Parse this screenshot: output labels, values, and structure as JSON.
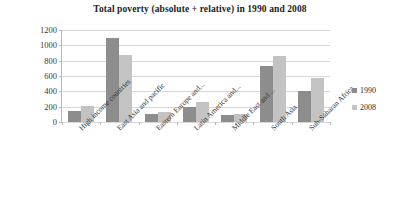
{
  "chart_data": {
    "type": "bar",
    "title": "Total poverty (absolute + relative) in 1990 and 2008",
    "xlabel": "",
    "ylabel": "",
    "ylim": [
      0,
      1200
    ],
    "yticks": [
      0,
      200,
      400,
      600,
      800,
      1000,
      1200
    ],
    "grid": true,
    "legend_position": "right",
    "categories": [
      "High income countries",
      "East Asia and pacific",
      "Eastern Europe and...",
      "Latin America and...",
      "Middle East and ...",
      "South Asia",
      "Sub-Saharan Africa"
    ],
    "series": [
      {
        "name": "1990",
        "color": "#8d8d8d",
        "values": [
          150,
          1100,
          110,
          200,
          90,
          730,
          400
        ]
      },
      {
        "name": "2008",
        "color": "#c3c3c3",
        "values": [
          215,
          880,
          130,
          260,
          100,
          860,
          570
        ]
      }
    ]
  }
}
